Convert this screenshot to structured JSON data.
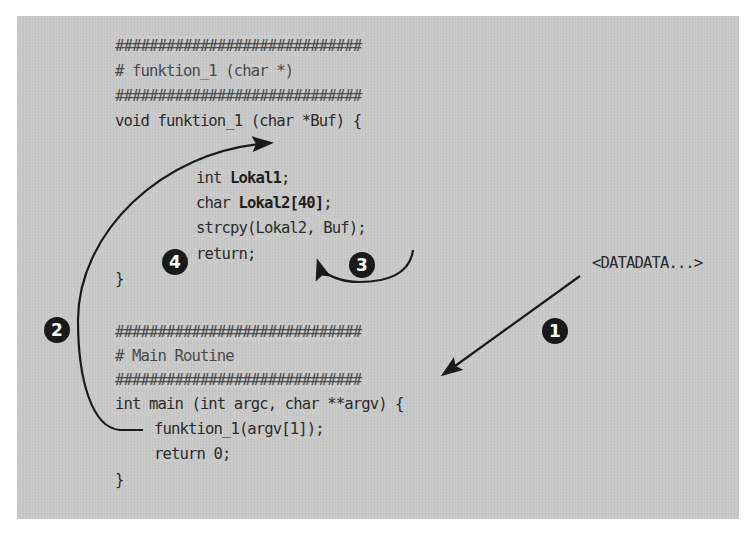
{
  "diagram": {
    "function_block": {
      "hash_line_top": "#############################",
      "comment": "# funktion_1 (char *)",
      "hash_line_bottom": "#############################",
      "signature": "void funktion_1 (char *Buf) {",
      "body": [
        {
          "kw": "int ",
          "bold": "Lokal1",
          "rest": ";"
        },
        {
          "kw": "char ",
          "bold": "Lokal2[40]",
          "rest": ";"
        },
        {
          "kw": "strcpy(Lokal2, Buf);",
          "bold": "",
          "rest": ""
        },
        {
          "kw": "return;",
          "bold": "",
          "rest": ""
        }
      ],
      "closing": "}"
    },
    "main_block": {
      "hash_line_top": "#############################",
      "comment": "# Main Routine",
      "hash_line_bottom": "#############################",
      "signature": "int main (int argc, char **argv) {",
      "body": [
        "funktion_1(argv[1]);",
        "return 0;"
      ],
      "closing": "}"
    },
    "input_label": "<DATADATA...>",
    "steps": [
      {
        "number": "1",
        "description": "Input data passed into main via argv"
      },
      {
        "number": "2",
        "description": "main calls funktion_1 with argv[1]"
      },
      {
        "number": "3",
        "description": "strcpy copies Buf into Lokal2"
      },
      {
        "number": "4",
        "description": "return from funktion_1"
      }
    ],
    "badge_labels": {
      "one": "1",
      "two": "2",
      "three": "3",
      "four": "4"
    },
    "colors": {
      "panel": "#c9c9c9",
      "text": "#2b2b2b",
      "arrow": "#1a1a1a",
      "badge": "#1a1a1a"
    }
  }
}
